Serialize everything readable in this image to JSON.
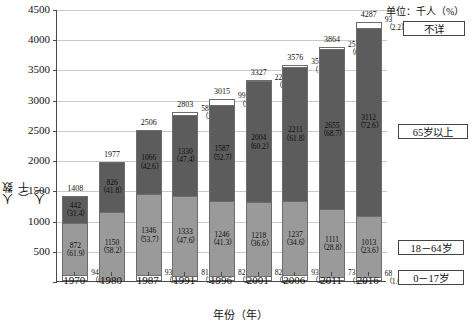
{
  "unit_note": "单位：千人（%）",
  "axes": {
    "ylabel": "人数（千人）",
    "xlabel": "年份（年）",
    "yticks": [
      "4500",
      "4000",
      "3500",
      "3000",
      "2500",
      "2000",
      "1500",
      "1000",
      "500"
    ],
    "ylim": [
      0,
      4500
    ]
  },
  "legend": {
    "unknown": "不详",
    "senior": "65岁以上",
    "adult": "18－64岁",
    "child": "0－17岁"
  },
  "chart_data": {
    "type": "bar",
    "title": "",
    "subtitle": "",
    "xlabel": "年份（年）",
    "ylabel": "人数（千人）",
    "ylim": [
      0,
      4500
    ],
    "ytick_values": [
      0,
      500,
      1000,
      1500,
      2000,
      2500,
      3000,
      3500,
      4000,
      4500
    ],
    "grid": true,
    "stacked": true,
    "unit": "千人（%）",
    "legend_position": "right",
    "categories": [
      "1970",
      "1980",
      "1987",
      "1991",
      "1996",
      "2001",
      "2006",
      "2011",
      "2016"
    ],
    "totals": [
      1408,
      1977,
      2506,
      2803,
      3015,
      3327,
      3576,
      3864,
      4287
    ],
    "series": [
      {
        "name": "不详",
        "key": "unknown",
        "values": [
          0,
          0,
          0,
          58,
          99,
          22,
          35,
          25,
          93
        ],
        "percents": [
          null,
          null,
          null,
          2.1,
          3.3,
          0.7,
          1.0,
          0.6,
          2.2
        ]
      },
      {
        "name": "65岁以上",
        "key": "senior",
        "values": [
          442,
          826,
          1066,
          1330,
          1587,
          2004,
          2211,
          2655,
          3112
        ],
        "percents": [
          31.4,
          41.8,
          42.6,
          47.4,
          52.7,
          60.2,
          61.8,
          68.7,
          72.6
        ]
      },
      {
        "name": "18－64岁",
        "key": "adult",
        "values": [
          872,
          1150,
          1346,
          1333,
          1246,
          1218,
          1237,
          1111,
          1013
        ],
        "percents": [
          61.9,
          58.2,
          53.7,
          47.6,
          41.3,
          36.6,
          34.6,
          28.8,
          23.6
        ]
      },
      {
        "name": "0－17岁",
        "key": "child",
        "values": [
          94,
          0,
          93,
          81,
          82,
          82,
          93,
          73,
          68
        ],
        "percents": [
          6.7,
          null,
          3.7,
          2.9,
          2.7,
          2.5,
          2.6,
          1.9,
          1.6
        ]
      }
    ]
  },
  "labels": {
    "totals": [
      "1408",
      "1977",
      "2506",
      "2803",
      "3015",
      "3327",
      "3576",
      "3864",
      "4287"
    ],
    "unknown_value": [
      "",
      "",
      "",
      "58",
      "99",
      "22",
      "35",
      "25",
      "93"
    ],
    "unknown_pct": [
      "",
      "",
      "",
      "（2.1）",
      "（3.3）",
      "（0.7）",
      "（1.0）",
      "（0.6）",
      "（2.2）"
    ],
    "senior_value": [
      "442",
      "826",
      "1066",
      "1330",
      "1587",
      "2004",
      "2211",
      "2655",
      "3112"
    ],
    "senior_pct": [
      "（31.4）",
      "（41.8）",
      "（42.6）",
      "（47.4）",
      "（52.7）",
      "（60.2）",
      "（61.8）",
      "（68.7）",
      "（72.6）"
    ],
    "adult_value": [
      "872",
      "1150",
      "1346",
      "1333",
      "1246",
      "1218",
      "1237",
      "1111",
      "1013"
    ],
    "adult_pct": [
      "（61.9）",
      "（58.2）",
      "（53.7）",
      "（47.6）",
      "（41.3）",
      "（36.6）",
      "（34.6）",
      "（28.8）",
      "（23.6）"
    ],
    "child_value": [
      "94",
      "",
      "93",
      "81",
      "82",
      "82",
      "93",
      "73",
      "68"
    ],
    "child_pct": [
      "（6.7）",
      "",
      "（3.7）",
      "（2.9）",
      "（2.7）",
      "（2.5）",
      "（2.6）",
      "（1.9）",
      "（1.6）"
    ]
  },
  "colors": {
    "senior_fill": "#5c5c5c",
    "adult_fill": "#9a9a9a",
    "unknown_fill": "#ffffff",
    "child_fill": "#ffffff",
    "grid": "#c9c9c9",
    "axis": "#4a4a4a"
  }
}
